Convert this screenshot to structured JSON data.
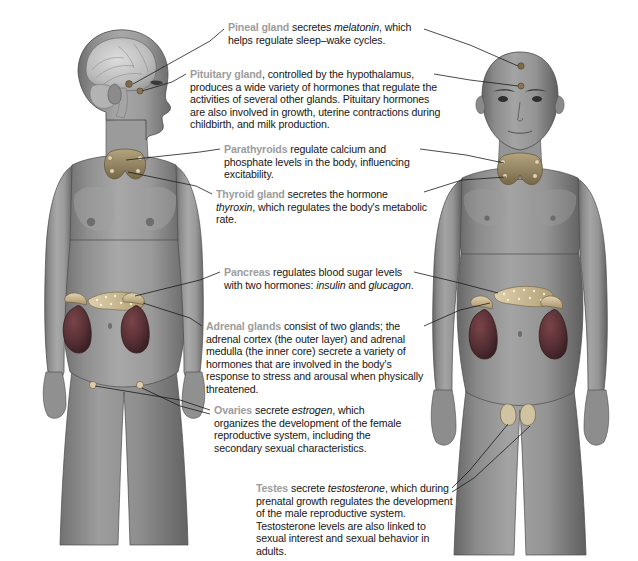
{
  "figure": {
    "background_color": "#ffffff",
    "label_color": "#9c9c9c",
    "text_color": "#161616",
    "leader_line_color": "#1c1c1c",
    "female": {
      "name": "female-figure",
      "description": "Female body, head shown in left-facing profile with brain cutaway",
      "skin_color": "#9a9a9a",
      "organs": [
        "brain",
        "pineal-gland",
        "pituitary-gland",
        "parathyroids",
        "thyroid-gland",
        "pancreas",
        "adrenal-glands",
        "kidneys",
        "ovaries"
      ]
    },
    "male": {
      "name": "male-figure",
      "description": "Male body, front facing, shaved head",
      "skin_color": "#8f8f8f",
      "organs": [
        "pineal-gland",
        "pituitary-gland",
        "parathyroids",
        "thyroid-gland",
        "pancreas",
        "adrenal-glands",
        "kidneys",
        "testes"
      ]
    },
    "organ_colors": {
      "kidney": "#5a3336",
      "adrenal": "#c7b089",
      "pancreas": "#cdbb93",
      "thyroid": "#9c8d6e",
      "brain": "#c9c9c9"
    }
  },
  "callouts": [
    {
      "id": "pineal",
      "gland": "Pineal gland",
      "text_before": " secretes ",
      "term": "melatonin",
      "text_after": ", which helps regulate sleep–wake cycles."
    },
    {
      "id": "pituitary",
      "gland": "Pituitary gland",
      "text": ", controlled by the hypothalamus, produces a wide variety of hormones that regulate the activities of several other glands. Pituitary hormones are also involved in growth, uterine contractions during childbirth, and milk production."
    },
    {
      "id": "parathyroids",
      "gland": "Parathyroids",
      "text": " regulate calcium and phosphate levels in the body, influencing excitability."
    },
    {
      "id": "thyroid",
      "gland": "Thyroid gland",
      "text_before": " secretes the hormone ",
      "term": "thyroxin",
      "text_after": ", which regulates the body's metabolic rate."
    },
    {
      "id": "pancreas",
      "gland": "Pancreas",
      "text_before": " regulates blood sugar levels with two hormones: ",
      "term": "insulin",
      "text_mid": " and ",
      "term2": "glucagon",
      "text_after": "."
    },
    {
      "id": "adrenal",
      "gland": "Adrenal glands",
      "text": " consist of two glands; the adrenal cortex (the outer layer) and adrenal medulla (the inner core) secrete a variety of hormones that are involved in the body's response to stress and arousal when physically threatened."
    },
    {
      "id": "ovaries",
      "gland": "Ovaries",
      "text_before": " secrete ",
      "term": "estrogen",
      "text_after": ", which organizes the development of the female reproductive system, including the secondary sexual characteristics."
    },
    {
      "id": "testes",
      "gland": "Testes",
      "text_before": " secrete ",
      "term": "testosterone",
      "text_after": ", which during prenatal growth regulates the development of the male reproductive system. Testosterone levels are also linked to sexual interest and sexual behavior in adults."
    }
  ]
}
